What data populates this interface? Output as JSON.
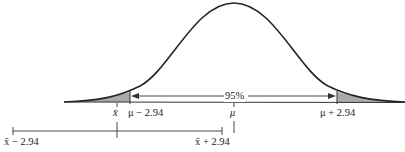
{
  "diagram": {
    "title": "",
    "center_label": "95%",
    "tick_labels": {
      "xbar": "x̄",
      "mu_minus": "μ − 2.94",
      "mu": "μ",
      "mu_plus": "μ + 2.94"
    },
    "interval_labels": {
      "left": "x̄ − 2.94",
      "right": "x̄ + 2.94"
    },
    "colors": {
      "curve": "#222222",
      "shade": "#a9a9a9",
      "axis": "#333333"
    }
  }
}
